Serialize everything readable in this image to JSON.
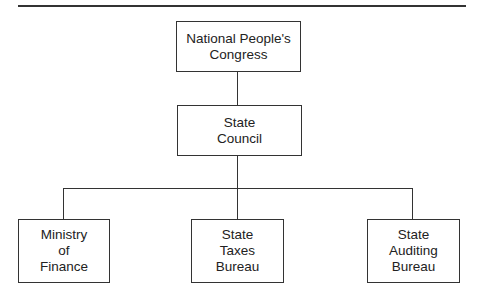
{
  "diagram": {
    "type": "organization-chart",
    "nodes": [
      {
        "id": "npc",
        "label": "National People's Congress",
        "lines": [
          "National People's",
          "Congress"
        ]
      },
      {
        "id": "council",
        "label": "State Council",
        "lines": [
          "State",
          "Council"
        ]
      },
      {
        "id": "finance",
        "label": "Ministry of Finance",
        "lines": [
          "Ministry",
          "of",
          "Finance"
        ]
      },
      {
        "id": "taxes",
        "label": "State Taxes Bureau",
        "lines": [
          "State",
          "Taxes",
          "Bureau"
        ]
      },
      {
        "id": "auditing",
        "label": "State Auditing Bureau",
        "lines": [
          "State",
          "Auditing",
          "Bureau"
        ]
      }
    ],
    "edges": [
      {
        "from": "npc",
        "to": "council"
      },
      {
        "from": "council",
        "to": "finance"
      },
      {
        "from": "council",
        "to": "taxes"
      },
      {
        "from": "council",
        "to": "auditing"
      }
    ]
  }
}
